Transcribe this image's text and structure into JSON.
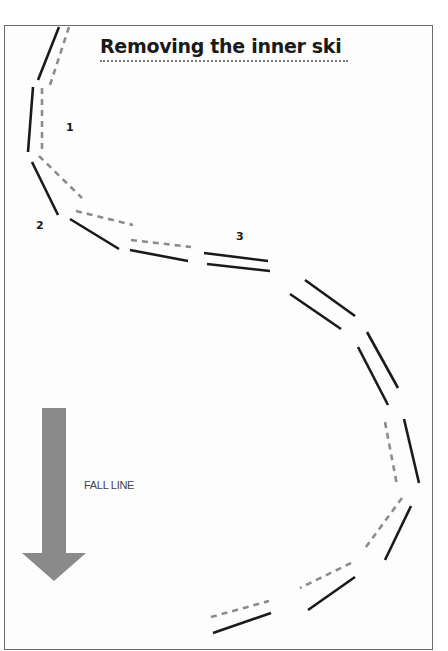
{
  "title": "Removing the inner ski",
  "labels": {
    "step1": "1",
    "step2": "2",
    "step3": "3",
    "fall_line": "FALL LINE"
  },
  "colors": {
    "ski_solid": "#1a1a1a",
    "ski_dashed": "#8c8c8c",
    "arrow": "#8a8a8a",
    "border": "#6a6a6a"
  },
  "diagram": {
    "segments": [
      {
        "type": "solid",
        "x1": 59,
        "y1": 27,
        "x2": 38,
        "y2": 80
      },
      {
        "type": "dashed",
        "x1": 69,
        "y1": 27,
        "x2": 50,
        "y2": 85
      },
      {
        "type": "solid",
        "x1": 33,
        "y1": 87,
        "x2": 28,
        "y2": 152
      },
      {
        "type": "dashed",
        "x1": 42,
        "y1": 88,
        "x2": 42,
        "y2": 152
      },
      {
        "type": "solid",
        "x1": 32,
        "y1": 162,
        "x2": 58,
        "y2": 215
      },
      {
        "type": "dashed",
        "x1": 39,
        "y1": 156,
        "x2": 82,
        "y2": 198
      },
      {
        "type": "solid",
        "x1": 70,
        "y1": 219,
        "x2": 119,
        "y2": 249
      },
      {
        "type": "dashed",
        "x1": 76,
        "y1": 211,
        "x2": 133,
        "y2": 225
      },
      {
        "type": "solid",
        "x1": 130,
        "y1": 250,
        "x2": 188,
        "y2": 261
      },
      {
        "type": "dashed",
        "x1": 131,
        "y1": 240,
        "x2": 191,
        "y2": 247
      },
      {
        "type": "solid",
        "x1": 204,
        "y1": 253,
        "x2": 268,
        "y2": 261
      },
      {
        "type": "solid",
        "x1": 207,
        "y1": 264,
        "x2": 270,
        "y2": 271
      },
      {
        "type": "solid",
        "x1": 305,
        "y1": 280,
        "x2": 355,
        "y2": 316
      },
      {
        "type": "solid",
        "x1": 290,
        "y1": 294,
        "x2": 341,
        "y2": 329
      },
      {
        "type": "solid",
        "x1": 367,
        "y1": 332,
        "x2": 398,
        "y2": 388
      },
      {
        "type": "solid",
        "x1": 358,
        "y1": 347,
        "x2": 388,
        "y2": 405
      },
      {
        "type": "dashed",
        "x1": 385,
        "y1": 422,
        "x2": 397,
        "y2": 485
      },
      {
        "type": "solid",
        "x1": 404,
        "y1": 419,
        "x2": 419,
        "y2": 483
      },
      {
        "type": "dashed",
        "x1": 402,
        "y1": 498,
        "x2": 366,
        "y2": 547
      },
      {
        "type": "solid",
        "x1": 411,
        "y1": 506,
        "x2": 385,
        "y2": 560
      },
      {
        "type": "dashed",
        "x1": 351,
        "y1": 563,
        "x2": 300,
        "y2": 588
      },
      {
        "type": "solid",
        "x1": 355,
        "y1": 577,
        "x2": 308,
        "y2": 610
      },
      {
        "type": "dashed",
        "x1": 211,
        "y1": 617,
        "x2": 269,
        "y2": 601
      },
      {
        "type": "solid",
        "x1": 213,
        "y1": 633,
        "x2": 271,
        "y2": 613
      }
    ]
  }
}
